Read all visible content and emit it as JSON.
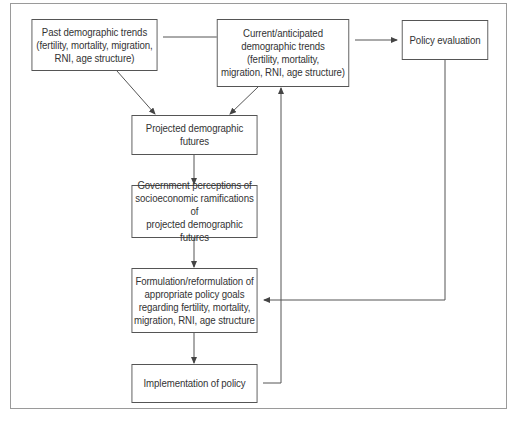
{
  "diagram": {
    "type": "flowchart",
    "nodes": [
      {
        "id": "past",
        "label": "Past demographic trends\n(fertility, mortality, migration,\nRNI, age structure)"
      },
      {
        "id": "current",
        "label": "Current/anticipated\ndemographic trends\n(fertility, mortality,\nmigration, RNI, age structure)"
      },
      {
        "id": "evaluation",
        "label": "Policy evaluation"
      },
      {
        "id": "projected",
        "label": "Projected demographic futures"
      },
      {
        "id": "perceptions",
        "label": "Government perceptions of\nsocioeconomic ramifications of\nprojected demographic futures"
      },
      {
        "id": "formulation",
        "label": "Formulation/reformulation of\nappropriate policy goals\nregarding fertility, mortality,\nmigration, RNI, age structure"
      },
      {
        "id": "implementation",
        "label": "Implementation of policy"
      }
    ],
    "edges": [
      {
        "from": "past",
        "to": "current"
      },
      {
        "from": "current",
        "to": "evaluation"
      },
      {
        "from": "past",
        "to": "projected"
      },
      {
        "from": "current",
        "to": "projected"
      },
      {
        "from": "projected",
        "to": "perceptions"
      },
      {
        "from": "perceptions",
        "to": "formulation"
      },
      {
        "from": "formulation",
        "to": "implementation"
      },
      {
        "from": "implementation",
        "to": "current"
      },
      {
        "from": "evaluation",
        "to": "formulation"
      }
    ]
  },
  "colors": {
    "line": "#555555",
    "frame": "#9a9a9a",
    "text": "#333333"
  }
}
